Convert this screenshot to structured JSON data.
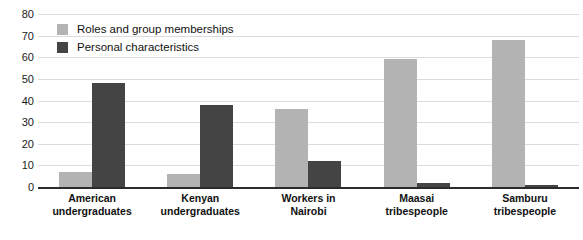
{
  "chart_data": {
    "type": "bar",
    "title": "",
    "xlabel": "",
    "ylabel": "",
    "ylim": [
      0,
      80
    ],
    "yticks": [
      0,
      10,
      20,
      30,
      40,
      50,
      60,
      70,
      80
    ],
    "grid": true,
    "legend_position": "top-left",
    "categories": [
      "American undergraduates",
      "Kenyan undergraduates",
      "Workers in Nairobi",
      "Maasai tribespeople",
      "Samburu tribespeople"
    ],
    "category_lines": [
      [
        "American",
        "undergraduates"
      ],
      [
        "Kenyan",
        "undergraduates"
      ],
      [
        "Workers in",
        "Nairobi"
      ],
      [
        "Maasai",
        "tribespeople"
      ],
      [
        "Samburu",
        "tribespeople"
      ]
    ],
    "series": [
      {
        "name": "Roles and group memberships",
        "color": "#b3b3b3",
        "values": [
          7,
          6,
          36,
          59,
          68
        ]
      },
      {
        "name": "Personal characteristics",
        "color": "#444444",
        "values": [
          48,
          38,
          12,
          2,
          1
        ]
      }
    ]
  },
  "axis": {
    "tick_labels": [
      "80",
      "70",
      "60",
      "50",
      "40",
      "30",
      "20",
      "10",
      "0"
    ]
  },
  "legend": {
    "items": [
      {
        "label": "Roles and group memberships",
        "swatch": "light"
      },
      {
        "label": "Personal characteristics",
        "swatch": "dark"
      }
    ]
  },
  "colors": {
    "light_bar": "#b3b3b3",
    "dark_bar": "#444444",
    "gridline": "#dcdcdc",
    "axis": "#2b2b2b",
    "background": "#ffffff",
    "text": "#111111"
  }
}
